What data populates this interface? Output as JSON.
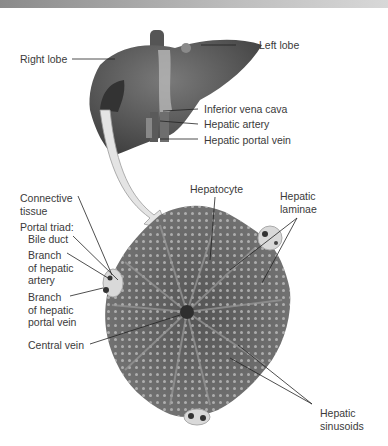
{
  "figure": {
    "top_strip": "",
    "liver_labels": {
      "right_lobe": "Right lobe",
      "left_lobe": "Left lobe",
      "inferior_vena_cava": "Inferior vena cava",
      "hepatic_artery": "Hepatic artery",
      "hepatic_portal_vein": "Hepatic portal vein"
    },
    "lobule_labels": {
      "connective_tissue": "Connective\ntissue",
      "portal_triad": "Portal triad:",
      "bile_duct": "Bile duct",
      "branch_hepatic_artery": "Branch\nof hepatic\nartery",
      "branch_hepatic_portal_vein": "Branch\nof hepatic\nportal vein",
      "central_vein": "Central vein",
      "hepatocyte": "Hepatocyte",
      "hepatic_laminae": "Hepatic\nlaminae",
      "hepatic_sinusoids": "Hepatic\nsinusoids"
    },
    "colors": {
      "liver": "#5e5e5e",
      "lobule": "#6f6f6f",
      "arrow": "#e4e4e4",
      "leader_line": "#222222",
      "text": "#3a3a3a"
    }
  }
}
